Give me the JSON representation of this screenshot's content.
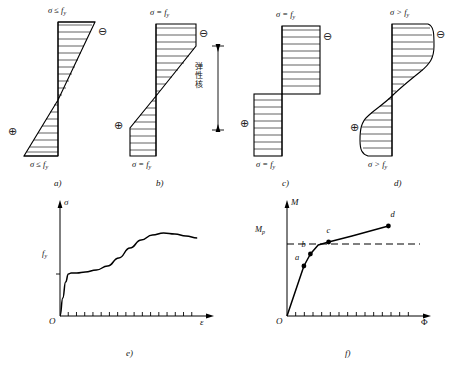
{
  "figure": {
    "title_present": false,
    "panels": [
      {
        "id": "a",
        "caption": "a)",
        "top_label": "σ ≤ f",
        "top_label_sub": "y",
        "bottom_label": "σ ≤ f",
        "bottom_label_sub": "y",
        "plus_symbol": "⊕",
        "minus_symbol": "⊖",
        "distribution": "elastic-triangular",
        "note": ""
      },
      {
        "id": "b",
        "caption": "b)",
        "top_label": "σ = f",
        "top_label_sub": "y",
        "bottom_label": "σ = f",
        "bottom_label_sub": "y",
        "plus_symbol": "⊕",
        "minus_symbol": "⊖",
        "distribution": "elasto-plastic",
        "note": "弹性核"
      },
      {
        "id": "c",
        "caption": "c)",
        "top_label": "σ = f",
        "top_label_sub": "y",
        "bottom_label": "σ = f",
        "bottom_label_sub": "y",
        "plus_symbol": "⊕",
        "minus_symbol": "⊖",
        "distribution": "fully-plastic-rectangular",
        "note": ""
      },
      {
        "id": "d",
        "caption": "d)",
        "top_label": "σ > f",
        "top_label_sub": "y",
        "bottom_label": "σ > f",
        "bottom_label_sub": "y",
        "plus_symbol": "⊕",
        "minus_symbol": "⊖",
        "distribution": "strain-hardened-s-curve",
        "note": ""
      }
    ]
  },
  "chart_data": [
    {
      "id": "e",
      "type": "line",
      "caption": "e)",
      "title": "",
      "xlabel": "ε",
      "ylabel": "σ",
      "origin_label": "O",
      "ytick_labels": [
        "f"
      ],
      "ytick_sub": "y",
      "ytick_values": [
        0.42
      ],
      "xlim": [
        0,
        1
      ],
      "ylim": [
        0,
        1
      ],
      "grid": false,
      "legend": "none",
      "x": [
        0.0,
        0.02,
        0.04,
        0.06,
        0.08,
        0.12,
        0.18,
        0.26,
        0.34,
        0.42,
        0.5,
        0.58,
        0.66,
        0.74,
        0.82,
        0.9,
        0.98
      ],
      "y": [
        0.0,
        0.18,
        0.34,
        0.42,
        0.43,
        0.43,
        0.44,
        0.46,
        0.5,
        0.58,
        0.68,
        0.76,
        0.81,
        0.83,
        0.82,
        0.8,
        0.78
      ],
      "annotations": []
    },
    {
      "id": "f",
      "type": "line",
      "caption": "f)",
      "title": "",
      "xlabel": "Φ",
      "ylabel": "M",
      "origin_label": "O",
      "ytick_labels": [
        "M"
      ],
      "ytick_sub": "p",
      "ytick_values": [
        0.72
      ],
      "xlim": [
        0,
        1
      ],
      "ylim": [
        0,
        1
      ],
      "grid": false,
      "legend": "none",
      "reference_line": {
        "label": "M",
        "label_sub": "p",
        "value": 0.72,
        "style": "dashed"
      },
      "x": [
        0.0,
        0.13,
        0.18,
        0.24,
        0.32,
        0.5,
        0.78
      ],
      "y": [
        0.0,
        0.5,
        0.62,
        0.71,
        0.74,
        0.8,
        0.9
      ],
      "points": [
        {
          "label": "a",
          "x": 0.13,
          "y": 0.5
        },
        {
          "label": "b",
          "x": 0.18,
          "y": 0.62
        },
        {
          "label": "c",
          "x": 0.32,
          "y": 0.74
        },
        {
          "label": "d",
          "x": 0.78,
          "y": 0.9
        }
      ],
      "annotations": []
    }
  ]
}
